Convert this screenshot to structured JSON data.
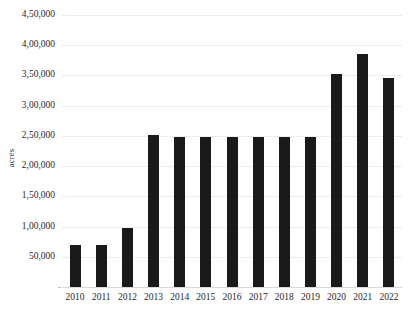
{
  "chart_data": {
    "type": "bar",
    "title": "",
    "xlabel": "",
    "ylabel": "acres",
    "categories": [
      "2010",
      "2011",
      "2012",
      "2013",
      "2014",
      "2015",
      "2016",
      "2017",
      "2018",
      "2019",
      "2020",
      "2021",
      "2022"
    ],
    "values": [
      70000,
      70000,
      97000,
      252000,
      248000,
      248000,
      248000,
      248000,
      248000,
      248000,
      353000,
      385000,
      346000
    ],
    "ylim": [
      0,
      450000
    ],
    "ytick_values": [
      50000,
      100000,
      150000,
      200000,
      250000,
      300000,
      350000,
      400000,
      450000
    ],
    "ytick_labels": [
      "50,000",
      "1,00,000",
      "1,50,000",
      "2,00,000",
      "2,50,000",
      "3,00,000",
      "3,50,000",
      "4,00,000",
      "4,50,000"
    ],
    "grid": true,
    "legend": false,
    "legend_position": "none",
    "bar_color": "#1a1a1a",
    "grid_color": "#ededed",
    "background_color": "#ffffff"
  }
}
